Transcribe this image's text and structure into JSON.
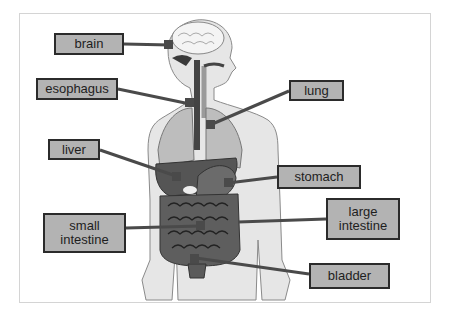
{
  "diagram": {
    "colors": {
      "label_fill": "#b3b3b3",
      "label_border": "#2b2b2b",
      "leader_line": "#4a4a4a",
      "body_fill": "#e6e6e6",
      "organ_dark": "#5a5a5a"
    },
    "labels": [
      {
        "id": "brain",
        "text": "brain"
      },
      {
        "id": "esophagus",
        "text": "esophagus"
      },
      {
        "id": "liver",
        "text": "liver"
      },
      {
        "id": "small_intestine",
        "text": "small intestine"
      },
      {
        "id": "lung",
        "text": "lung"
      },
      {
        "id": "stomach",
        "text": "stomach"
      },
      {
        "id": "large_intestine",
        "text": "large intestine"
      },
      {
        "id": "bladder",
        "text": "bladder"
      }
    ]
  }
}
